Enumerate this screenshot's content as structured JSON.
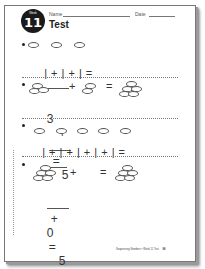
{
  "header": {
    "week_label": "Week",
    "week_number": "11",
    "name_label": "Name",
    "date_label": "Date",
    "title": "Test"
  },
  "problems": [
    {
      "number": "1",
      "picture": {
        "left_ovals": 3
      },
      "equation": "| + | + | =",
      "answer": ""
    },
    {
      "number": "2",
      "picture": {
        "group_a": 3,
        "group_b": 2,
        "total": 5
      },
      "equation": {
        "left": "3",
        "plus": "+",
        "blank": "",
        "equals": "=",
        "right": "5"
      }
    },
    {
      "number": "3",
      "picture": {
        "left_ovals": 5
      },
      "equation": "| + | + | + | + | =",
      "answer": ""
    },
    {
      "number": "4",
      "picture": {
        "group_a": 5,
        "group_b": 0,
        "total": 5
      },
      "equation": {
        "blank": "",
        "plus": "+",
        "middle": "0",
        "equals": "=",
        "right": "5"
      }
    }
  ],
  "picture_symbols": {
    "plus": "+",
    "equals": "="
  },
  "footer": {
    "text": "Sequencing Numbers • Week 11 Test",
    "page": "98"
  }
}
